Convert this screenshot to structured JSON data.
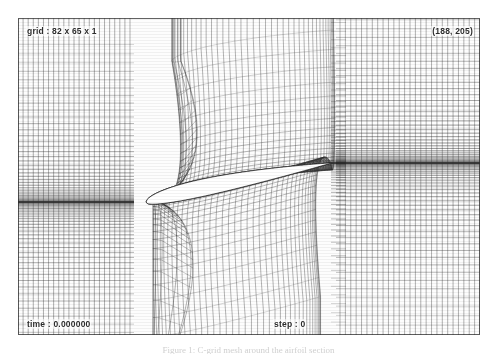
{
  "figure": {
    "type": "cfd-mesh-visualization",
    "background_color": "#ffffff",
    "frame_color": "#fdfdfd",
    "line_color": "#3a3a3a",
    "body_fill_color": "#ffffff"
  },
  "labels": {
    "grid": "grid : 82 x 65 x 1",
    "coords": "(188, 205)",
    "time": "time : 0.000000",
    "step": "step : 0"
  },
  "caption": {
    "text": "Figure 1: C-grid mesh around the airfoil section"
  },
  "chart_data": {
    "type": "mesh",
    "title": "grid : 82 x 65 x 1",
    "topology": "C-grid",
    "dimensions": {
      "i": 82,
      "j": 65,
      "k": 1
    },
    "annotations": [
      {
        "position": "top-left",
        "text": "grid : 82 x 65 x 1"
      },
      {
        "position": "top-right",
        "text": "(188, 205)"
      },
      {
        "position": "bottom-left",
        "text": "time : 0.000000"
      },
      {
        "position": "bottom-center",
        "text": "step : 0"
      }
    ],
    "body": {
      "name": "airfoil",
      "fill": "#ffffff",
      "outline": "#2a2a2a",
      "chord_extent_px": [
        145,
        330
      ],
      "leading_edge_px": [
        146,
        202
      ],
      "trailing_edge_px": [
        331,
        163
      ]
    },
    "regions": [
      {
        "name": "upstream-left",
        "x_px": [
          0,
          130
        ],
        "description": "rectangular cartesian block, horizontal lines clustered toward airfoil mid-height"
      },
      {
        "name": "body-fitted-core",
        "x_px": [
          130,
          340
        ],
        "description": "curved body-fitted C-grid wrapping the airfoil, dense normal clustering"
      },
      {
        "name": "wake-right",
        "x_px": [
          340,
          462
        ],
        "description": "rectangular wake block with strong horizontal clustering along the wake cut"
      }
    ],
    "grid_on": true,
    "legend": "none"
  }
}
